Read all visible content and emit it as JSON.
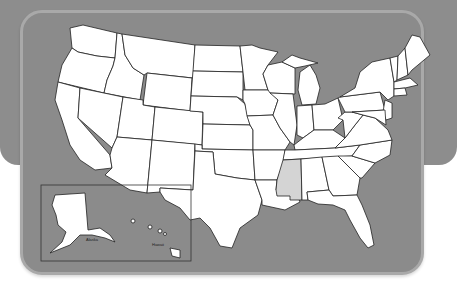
{
  "map": {
    "title": "United States",
    "highlighted_state": "Mississippi",
    "highlight_color": "#d4d4d4",
    "state_fill": "#ffffff",
    "water_color": "#8b8b8b",
    "border_color": "#a9a9a9",
    "inset": {
      "labels": [
        "Alaska",
        "Hawaii"
      ]
    }
  }
}
